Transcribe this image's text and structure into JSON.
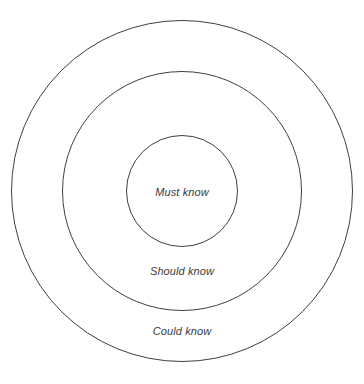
{
  "diagram": {
    "type": "concentric-circles",
    "background_color": "#ffffff",
    "stroke_color": "#3f3f3f",
    "stroke_width": 1,
    "text_color": "#3a3a3a",
    "center": {
      "x": 182,
      "y": 191
    },
    "rings": [
      {
        "id": "could-know",
        "label": "Could know",
        "level": 3,
        "radius": 171,
        "diameter": 342,
        "label_position": {
          "x": 182,
          "y": 331
        }
      },
      {
        "id": "should-know",
        "label": "Should know",
        "level": 2,
        "radius": 120,
        "diameter": 240,
        "label_position": {
          "x": 182,
          "y": 271
        }
      },
      {
        "id": "must-know",
        "label": "Must know",
        "level": 1,
        "radius": 56,
        "diameter": 112,
        "label_position": {
          "x": 182,
          "y": 192
        }
      }
    ]
  }
}
